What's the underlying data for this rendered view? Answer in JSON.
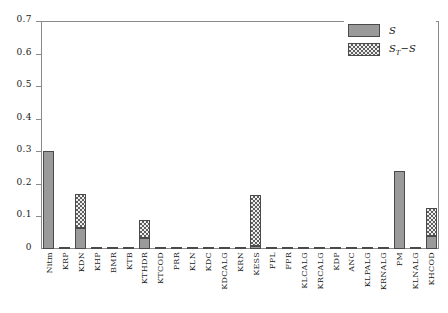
{
  "chart_data": {
    "type": "bar",
    "title": "",
    "subtitle": "",
    "xlabel": "",
    "ylabel": "",
    "stacked": true,
    "grid": false,
    "ylim": [
      0,
      0.7
    ],
    "ytick_labels": [
      "0",
      "0.1",
      "0.2",
      "0.3",
      "0.4",
      "0.5",
      "0.6",
      "0.7"
    ],
    "ytick_values": [
      0,
      0.1,
      0.2,
      0.3,
      0.4,
      0.5,
      0.6,
      0.7
    ],
    "legend_position": "top-right",
    "legend": [
      "S",
      "ST-S"
    ],
    "categories": [
      "Nitm",
      "KRP",
      "KDN",
      "KHP",
      "BMR",
      "KTB",
      "KTHDR",
      "KTCOD",
      "PRR",
      "KLN",
      "KDC",
      "KDCALG",
      "KRN",
      "KESS",
      "FPL",
      "FPR",
      "KLCALG",
      "KRCALG",
      "KDP",
      "ANC",
      "KLPALG",
      "KRNALG",
      "PM",
      "KLNALG",
      "KHCOD"
    ],
    "series": [
      {
        "name": "S",
        "values": [
          0.3,
          0.005,
          0.065,
          0.005,
          0.005,
          0.005,
          0.035,
          0.005,
          0.005,
          0.005,
          0.005,
          0.005,
          0.005,
          0.008,
          0.005,
          0.005,
          0.005,
          0.005,
          0.005,
          0.005,
          0.005,
          0.005,
          0.24,
          0.005,
          0.04
        ]
      },
      {
        "name": "ST-S",
        "values": [
          0.0,
          0.0,
          0.105,
          0.0,
          0.0,
          0.0,
          0.055,
          0.0,
          0.0,
          0.0,
          0.0,
          0.0,
          0.0,
          0.157,
          0.0,
          0.0,
          0.0,
          0.0,
          0.0,
          0.0,
          0.0,
          0.0,
          0.0,
          0.0,
          0.085
        ]
      }
    ],
    "totals": [
      0.3,
      0.005,
      0.17,
      0.005,
      0.005,
      0.005,
      0.09,
      0.005,
      0.005,
      0.005,
      0.005,
      0.005,
      0.005,
      0.165,
      0.005,
      0.005,
      0.005,
      0.005,
      0.005,
      0.005,
      0.005,
      0.005,
      0.24,
      0.005,
      0.125
    ]
  },
  "legend": {
    "items": [
      {
        "label": "S",
        "sub": "",
        "tail": "",
        "swatch": "solid",
        "color": "#9a9a9a"
      },
      {
        "label": "S",
        "sub": "T",
        "tail": "−S",
        "swatch": "hatched",
        "color": "#5f5f5f"
      }
    ]
  },
  "colors": {
    "bar_solid": "#9a9a9a",
    "bar_hatch": "#5f5f5f",
    "bar_edge": "#4a4a4a",
    "axis": "#8a8a8a",
    "text": "#1a1a1a",
    "background": "#ffffff"
  }
}
